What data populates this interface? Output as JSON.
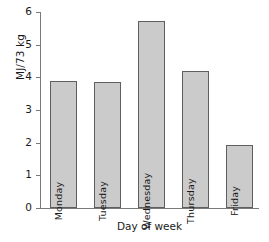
{
  "chart_data": {
    "type": "bar",
    "title": "",
    "subtitle": "",
    "xlabel": "Day of week",
    "ylabel": "MJ/73 kg",
    "categories": [
      "Monday",
      "Tuesday",
      "Wednesday",
      "Thursday",
      "Friday"
    ],
    "values": [
      3.88,
      3.87,
      5.73,
      4.18,
      1.92
    ],
    "ylim": [
      0,
      6
    ],
    "yticks": [
      0,
      1,
      2,
      3,
      4,
      5,
      6
    ],
    "ytick_labels": [
      "0",
      "1",
      "2",
      "3",
      "4",
      "5",
      "6"
    ],
    "xtick_labels": [],
    "grid": false,
    "legend": null,
    "annotations": [],
    "bar_label_position": "inside-rotated-bottom",
    "colors": {
      "bar_fill": "#cbcbcb",
      "bar_edge": "#5f5f5f",
      "axis": "#7a7a7a",
      "text": "#1a1a1a",
      "background": "#ffffff"
    }
  }
}
